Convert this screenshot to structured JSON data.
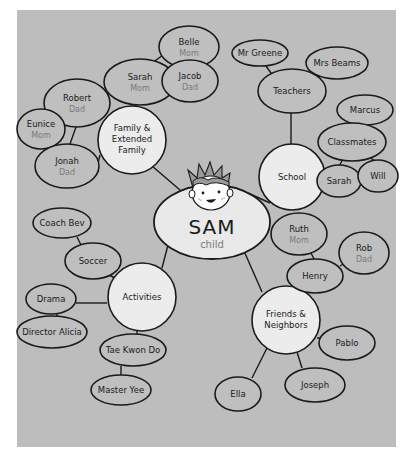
{
  "diagram": {
    "type": "mind-map",
    "colors": {
      "background": "#ffffff",
      "panel": "#bdbdbd",
      "bubble_fill": "#bfbfbf",
      "hub_fill": "#ececec",
      "outline": "#1a1a1a",
      "role_text": "#7a7a7a"
    },
    "root": {
      "name": "SAM",
      "role": "child",
      "icon": "boy-face-icon"
    },
    "branches": {
      "family": {
        "label_line1": "Family &",
        "label_line2": "Extended",
        "label_line3": "Family",
        "nodes": {
          "sarah": {
            "name": "Sarah",
            "role": "Mom"
          },
          "belle": {
            "name": "Belle",
            "role": "Mom"
          },
          "jacob": {
            "name": "Jacob",
            "role": "Dad"
          },
          "jonah": {
            "name": "Jonah",
            "role": "Dad"
          },
          "robert": {
            "name": "Robert",
            "role": "Dad"
          },
          "eunice": {
            "name": "Eunice",
            "role": "Mom"
          }
        }
      },
      "school": {
        "label": "School",
        "nodes": {
          "teachers": {
            "name": "Teachers"
          },
          "mr_greene": {
            "name": "Mr Greene"
          },
          "mrs_beams": {
            "name": "Mrs Beams"
          },
          "classmates": {
            "name": "Classmates"
          },
          "marcus": {
            "name": "Marcus"
          },
          "sarah": {
            "name": "Sarah"
          },
          "will": {
            "name": "Will"
          }
        }
      },
      "activities": {
        "label": "Activities",
        "nodes": {
          "soccer": {
            "name": "Soccer"
          },
          "coach_bev": {
            "name": "Coach Bev"
          },
          "drama": {
            "name": "Drama"
          },
          "director_alicia": {
            "name": "Director Alicia"
          },
          "tae_kwon_do": {
            "name": "Tae Kwon Do"
          },
          "master_yee": {
            "name": "Master Yee"
          }
        }
      },
      "friends": {
        "label_line1": "Friends &",
        "label_line2": "Neighbors",
        "nodes": {
          "henry": {
            "name": "Henry"
          },
          "ruth": {
            "name": "Ruth",
            "role": "Mom"
          },
          "rob": {
            "name": "Rob",
            "role": "Dad"
          },
          "pablo": {
            "name": "Pablo"
          },
          "joseph": {
            "name": "Joseph"
          },
          "ella": {
            "name": "Ella"
          }
        }
      }
    }
  }
}
